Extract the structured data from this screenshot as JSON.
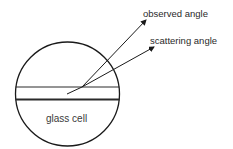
{
  "diagram": {
    "title": "",
    "labels": {
      "observed": "observed angle",
      "scattering": "scattering angle",
      "cell": "glass cell"
    },
    "elements": {
      "cell_circle": {
        "cx": 67.5,
        "cy": 94,
        "r": 52
      },
      "channel_top_y": 87,
      "channel_bottom_y": 99,
      "scatter_origin": {
        "x": 82,
        "y": 87
      },
      "incident_start": {
        "x": 67,
        "y": 94
      },
      "observed_tip": {
        "x": 146,
        "y": 20
      },
      "scattering_tip": {
        "x": 154,
        "y": 47
      }
    },
    "colors": {
      "stroke": "#1a1a1a",
      "text": "#2a2a2a",
      "background": "#ffffff"
    }
  }
}
